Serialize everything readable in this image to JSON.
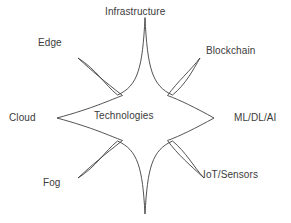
{
  "diagram": {
    "type": "star-burst",
    "center": {
      "label": "Technologies",
      "x": 94,
      "y": 116
    },
    "stroke_color": "#3f3f3f",
    "text_color": "#3b3b3b",
    "background_color": "#ffffff",
    "points": [
      {
        "id": "infrastructure",
        "label": "Infrastructure",
        "direction": "top",
        "label_x": 105,
        "label_y": 6,
        "tip_x": 145,
        "tip_y": 18
      },
      {
        "id": "blockchain",
        "label": "Blockchain",
        "direction": "top-right",
        "label_x": 206,
        "label_y": 45,
        "tip_x": 200,
        "tip_y": 58
      },
      {
        "id": "ml-dl-ai",
        "label": "ML/DL/AI",
        "direction": "right",
        "label_x": 234,
        "label_y": 112,
        "tip_x": 214,
        "tip_y": 118
      },
      {
        "id": "iot-sensors",
        "label": "IoT/Sensors",
        "direction": "bottom-right",
        "label_x": 203,
        "label_y": 169,
        "tip_x": 204,
        "tip_y": 178
      },
      {
        "id": "unlabeled-bottom",
        "label": "",
        "direction": "bottom",
        "label_x": 0,
        "label_y": 0,
        "tip_x": 145,
        "tip_y": 214
      },
      {
        "id": "fog",
        "label": "Fog",
        "direction": "bottom-left",
        "label_x": 43,
        "label_y": 177,
        "tip_x": 78,
        "tip_y": 178
      },
      {
        "id": "cloud",
        "label": "Cloud",
        "direction": "left",
        "label_x": 9,
        "label_y": 112,
        "tip_x": 57,
        "tip_y": 118
      },
      {
        "id": "edge",
        "label": "Edge",
        "direction": "top-left",
        "label_x": 38,
        "label_y": 37,
        "tip_x": 78,
        "tip_y": 58
      }
    ]
  }
}
